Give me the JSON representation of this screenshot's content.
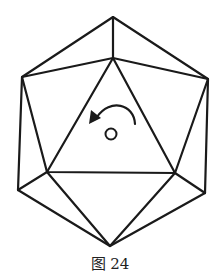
{
  "figure": {
    "caption": "图 24",
    "stroke_color": "#1a1a1a",
    "background": "#ffffff",
    "annotations": {
      "rotation_arrow": "counter-clockwise",
      "center_marker": "circle"
    }
  }
}
